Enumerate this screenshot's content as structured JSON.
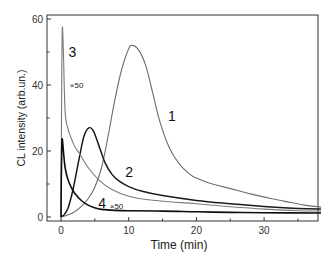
{
  "chart_data": {
    "type": "line",
    "title": "",
    "xlabel": "Time (min)",
    "ylabel": "CL intensity (arb.un.)",
    "xlim": [
      -2,
      38.4
    ],
    "ylim": [
      -1,
      61
    ],
    "x_ticks": [
      0,
      10,
      20,
      30
    ],
    "x_minor_ticks": [
      5,
      15,
      25,
      35
    ],
    "y_ticks": [
      0,
      20,
      40,
      60
    ],
    "y_minor_ticks": [
      10,
      30,
      50
    ],
    "grid": false,
    "legend": "none (curves labeled inline)",
    "series": [
      {
        "name": "1",
        "color": "#6e6e6e",
        "line_width": 1.1,
        "label_pos": [
          15.8,
          29
        ],
        "points": [
          [
            0,
            0
          ],
          [
            1,
            0.6
          ],
          [
            2,
            1.6
          ],
          [
            3,
            3.2
          ],
          [
            4,
            5.5
          ],
          [
            5,
            9
          ],
          [
            6,
            15
          ],
          [
            7,
            25
          ],
          [
            8,
            36
          ],
          [
            9,
            45
          ],
          [
            10,
            51
          ],
          [
            10.6,
            52
          ],
          [
            11.5,
            50.5
          ],
          [
            12.5,
            46
          ],
          [
            13.5,
            38
          ],
          [
            14.6,
            29
          ],
          [
            16,
            21
          ],
          [
            17.5,
            16
          ],
          [
            19,
            13
          ],
          [
            20,
            11.8
          ],
          [
            22,
            10.2
          ],
          [
            25,
            8.6
          ],
          [
            28,
            7
          ],
          [
            31,
            5.6
          ],
          [
            34,
            4.4
          ],
          [
            36,
            3.6
          ],
          [
            38.4,
            3
          ]
        ]
      },
      {
        "name": "2",
        "color": "#1a1a1a",
        "line_width": 1.5,
        "label_pos": [
          9.5,
          12
        ],
        "points": [
          [
            0,
            0
          ],
          [
            0.5,
            0.8
          ],
          [
            1,
            2.5
          ],
          [
            1.5,
            6
          ],
          [
            2,
            10.5
          ],
          [
            2.8,
            19
          ],
          [
            3.4,
            24.5
          ],
          [
            4.1,
            27
          ],
          [
            4.8,
            26
          ],
          [
            5.7,
            21
          ],
          [
            6.5,
            16.5
          ],
          [
            7.5,
            13
          ],
          [
            8.5,
            11
          ],
          [
            10,
            9.2
          ],
          [
            12,
            7.8
          ],
          [
            15,
            6.5
          ],
          [
            20,
            5
          ],
          [
            25,
            4
          ],
          [
            30,
            3.2
          ],
          [
            35,
            2.6
          ],
          [
            38.4,
            2.4
          ]
        ]
      },
      {
        "name": "3",
        "annotation": "×50",
        "color": "#7a7a7a",
        "line_width": 1.1,
        "label_pos": [
          1.1,
          48.5
        ],
        "annotation_pos": [
          1.3,
          39
        ],
        "points": [
          [
            0,
            0
          ],
          [
            0.05,
            20
          ],
          [
            0.12,
            45
          ],
          [
            0.2,
            57.5
          ],
          [
            0.35,
            50
          ],
          [
            0.6,
            32
          ],
          [
            1,
            27
          ],
          [
            1.3,
            25
          ],
          [
            2,
            21.5
          ],
          [
            2.8,
            19
          ],
          [
            4,
            15
          ],
          [
            5.7,
            11
          ],
          [
            7.5,
            8.3
          ],
          [
            10,
            6.3
          ],
          [
            13,
            5.2
          ],
          [
            16,
            4.6
          ],
          [
            20,
            4
          ],
          [
            25,
            3.1
          ],
          [
            30,
            2.4
          ],
          [
            35,
            1.9
          ],
          [
            38.4,
            1.8
          ]
        ]
      },
      {
        "name": "4",
        "annotation": "×50",
        "color": "#0d0d0d",
        "line_width": 1.6,
        "label_pos": [
          5.5,
          2.6
        ],
        "annotation_pos": [
          7.2,
          2.4
        ],
        "points": [
          [
            0,
            0
          ],
          [
            0.05,
            12
          ],
          [
            0.12,
            22
          ],
          [
            0.2,
            23.5
          ],
          [
            0.35,
            20
          ],
          [
            0.6,
            15
          ],
          [
            1,
            11.5
          ],
          [
            1.5,
            9
          ],
          [
            2,
            7.3
          ],
          [
            3,
            5
          ],
          [
            4,
            3.6
          ],
          [
            5,
            2.8
          ],
          [
            6,
            2.3
          ],
          [
            8,
            2
          ],
          [
            10,
            1.9
          ],
          [
            15,
            1.8
          ],
          [
            20,
            1.6
          ],
          [
            25,
            1.4
          ],
          [
            30,
            1.3
          ],
          [
            38.4,
            1.2
          ]
        ]
      }
    ]
  }
}
